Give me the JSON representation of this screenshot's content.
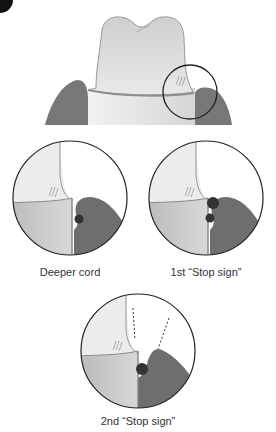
{
  "figure": {
    "type": "dental-diagram",
    "panels": [
      {
        "id": "overview",
        "description": "tooth crown with gingiva, magnifier circle at right margin"
      },
      {
        "id": "deeper-cord",
        "label": "Deeper cord"
      },
      {
        "id": "first-stop-sign",
        "label": "1st “Stop sign”"
      },
      {
        "id": "second-stop-sign",
        "label": "2nd “Stop sign”"
      }
    ]
  },
  "colors": {
    "enamel": "#d9d9d9",
    "root": "#e6e6e6",
    "gingiva": "#6e6e6e",
    "cord": "#3a3a3a",
    "outline": "#222222"
  }
}
